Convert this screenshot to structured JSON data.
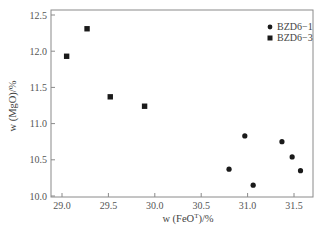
{
  "chart_data": {
    "type": "scatter",
    "title": "",
    "xlabel": "w (FeO^T)/%",
    "ylabel": "w (MgO)/%",
    "xlim": [
      28.9,
      31.7
    ],
    "ylim": [
      10.0,
      12.5
    ],
    "xticks": [
      29.0,
      29.5,
      30.0,
      30.5,
      31.0,
      31.5
    ],
    "yticks": [
      10.0,
      10.5,
      11.0,
      11.5,
      12.0,
      12.5
    ],
    "grid": false,
    "legend_position": "upper right",
    "series": [
      {
        "name": "BZD6−1",
        "marker": "circle",
        "color": "#1a1a1a",
        "points": [
          {
            "x": 30.8,
            "y": 10.37
          },
          {
            "x": 30.97,
            "y": 10.83
          },
          {
            "x": 31.06,
            "y": 10.15
          },
          {
            "x": 31.37,
            "y": 10.75
          },
          {
            "x": 31.48,
            "y": 10.54
          },
          {
            "x": 31.57,
            "y": 10.35
          }
        ]
      },
      {
        "name": "BZD6−3",
        "marker": "square",
        "color": "#1a1a1a",
        "points": [
          {
            "x": 29.05,
            "y": 11.93
          },
          {
            "x": 29.27,
            "y": 12.31
          },
          {
            "x": 29.52,
            "y": 11.37
          },
          {
            "x": 29.89,
            "y": 11.24
          }
        ]
      }
    ]
  },
  "labels": {
    "xlabel_main": "w (FeO",
    "xlabel_sup": "T",
    "xlabel_tail": ")/%",
    "ylabel": "w (MgO)/%",
    "legend": [
      "BZD6−1",
      "BZD6−3"
    ]
  }
}
